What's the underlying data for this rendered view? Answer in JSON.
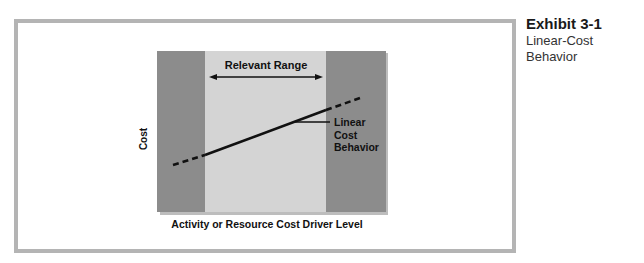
{
  "caption": {
    "exhibit_number": "Exhibit 3-1",
    "title": "Linear-Cost Behavior"
  },
  "diagram": {
    "relevant_range_label": "Relevant Range",
    "line_label_line1": "Linear",
    "line_label_line2": "Cost",
    "line_label_line3": "Behavior",
    "y_axis_label": "Cost",
    "x_axis_label": "Activity or Resource Cost Driver Level"
  },
  "colors": {
    "frame": "#b4b4b4",
    "outer_band": "#8c8c8c",
    "relevant_range_band": "#d4d4d4",
    "line": "#111111"
  }
}
